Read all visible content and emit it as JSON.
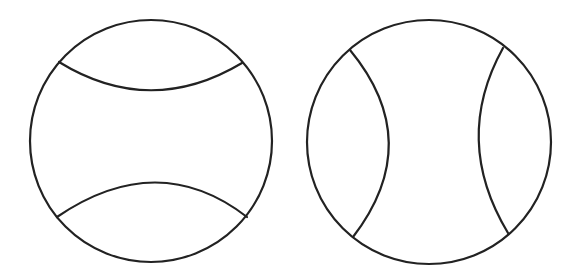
{
  "figures": [
    {
      "name": "ball-horizontal-seams",
      "circle": {
        "cx": 151,
        "cy": 141,
        "r": 121
      },
      "seams": [
        "M 59 62 Q 150 118 242 63",
        "M 57 217 Q 158 148 247 217"
      ]
    },
    {
      "name": "ball-vertical-seams",
      "circle": {
        "cx": 429,
        "cy": 142,
        "r": 122
      },
      "seams": [
        "M 350 50 Q 426 142 353 237",
        "M 503 48 Q 452 140 508 233"
      ]
    }
  ],
  "colors": {
    "stroke": "#222222",
    "background": "#ffffff"
  }
}
